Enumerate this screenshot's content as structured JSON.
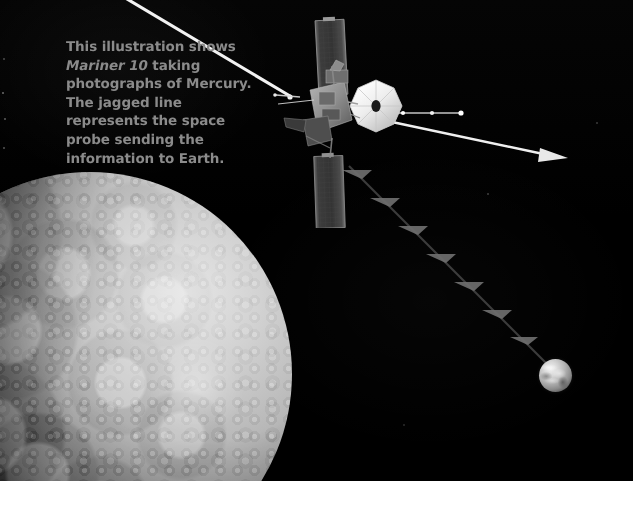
{
  "figure": {
    "caption": {
      "lead": "This illustration shows ",
      "spacecraft_name": "Mariner 10",
      "rest": " taking photographs of Mercury. The jagged line represents the space probe sending the information to Earth.",
      "color": "#8b8b8b"
    }
  },
  "scene": {
    "background_color": "#000000",
    "page_color": "#ffffff",
    "objects": {
      "planet": {
        "name": "Mercury",
        "label": "mercury-planet",
        "surface": "heavily cratered",
        "lit_side": "upper right",
        "color_light": "#e6e6e6",
        "color_dark": "#141414"
      },
      "probe": {
        "name": "Mariner 10",
        "label": "mariner-10-spacecraft",
        "parts": [
          "upper-solar-panel",
          "lower-solar-panel",
          "high-gain-dish-antenna",
          "spacecraft-bus",
          "magnetometer-boom",
          "low-gain-antenna-boom",
          "sunshade-vane"
        ],
        "dish_color": "#efefef",
        "panel_color": "#3a3a3a",
        "body_color": "#9a9a9a"
      },
      "earth": {
        "name": "Earth",
        "label": "earth-planet",
        "color_light": "#f0f0f0",
        "color_dark": "#1d1d1d"
      },
      "signal": {
        "name": "data transmission",
        "label": "jagged-signal-line",
        "style": "jagged lightning line from probe to Earth",
        "color": "#5a5a5a"
      }
    }
  }
}
